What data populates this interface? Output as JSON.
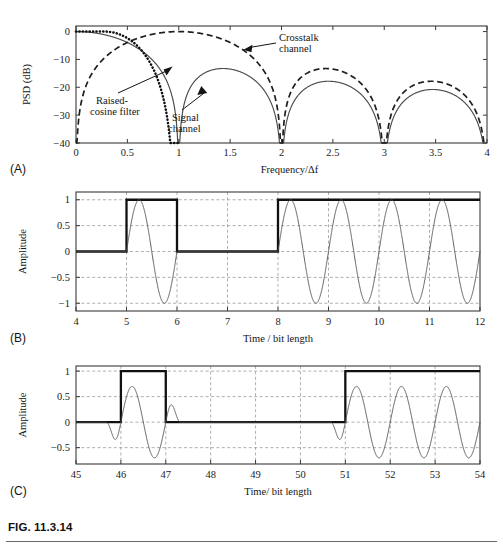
{
  "figure": {
    "caption": "FIG. 11.3.14",
    "panel_letters": {
      "a": "(A)",
      "b": "(B)",
      "c": "(C)"
    }
  },
  "chart_data": [
    {
      "id": "panel-a",
      "type": "line",
      "title": "",
      "xlabel": "Frequency/Δf",
      "ylabel": "PSD (dB)",
      "xlim": [
        0,
        4
      ],
      "ylim": [
        -40,
        2
      ],
      "xticks": [
        0,
        0.5,
        1,
        1.5,
        2,
        2.5,
        3,
        3.5,
        4
      ],
      "xticklabels": [
        "0",
        "0.5",
        "1",
        "1.5",
        "2",
        "2.5",
        "3",
        "3.5",
        "4"
      ],
      "yticks": [
        0,
        -10,
        -20,
        -30,
        -40
      ],
      "yticklabels": [
        "0",
        "−10",
        "−20",
        "−30",
        "−40"
      ],
      "grid": false,
      "legend_position": "annotations",
      "series": [
        {
          "name": "Signal channel",
          "style": "solid",
          "description": "sinc-squared main lobe centred at 0 with nulls at 1, 2, 3, 4",
          "nulls": [
            1,
            2,
            3,
            4
          ],
          "lobe_peaks_db": [
            0,
            -13.3,
            -18.2,
            -21.2
          ],
          "lobe_peak_x": [
            0,
            1.43,
            2.45,
            3.47
          ]
        },
        {
          "name": "Crosstalk channel",
          "style": "dashed",
          "description": "sinc-squared main lobe centred at 1 with nulls at 0, 2, 3, 4",
          "nulls": [
            0,
            2,
            3,
            4
          ],
          "lobe_peaks_db": [
            0,
            -13.3,
            -18.2
          ],
          "lobe_peak_x": [
            1,
            2.45,
            3.47
          ]
        },
        {
          "name": "Raised-cosine filter",
          "style": "dotted",
          "description": "raised cosine roll-off falling from 0 dB to the stop band near 1",
          "knee_x": 0.5,
          "cutoff_x": 1
        }
      ],
      "annotations": [
        {
          "text": "Crosstalk\nchannel",
          "lines": [
            "Crosstalk",
            "channel"
          ],
          "target_x": 1.63,
          "target_y_db": -6.5
        },
        {
          "text": "Raised-\ncosine filter",
          "lines": [
            "Raised-",
            "cosine filter"
          ],
          "target_x": 0.93,
          "target_y_db": -12.5
        },
        {
          "text": "Signal\nchannel",
          "lines": [
            "Signal",
            "channel"
          ],
          "target_x": 1.2,
          "target_y_db": -19.5
        }
      ]
    },
    {
      "id": "panel-b",
      "type": "line",
      "title": "",
      "xlabel": "Time / bit length",
      "ylabel": "Amplitude",
      "xlim": [
        4,
        12
      ],
      "ylim": [
        -1.15,
        1.15
      ],
      "xticks": [
        4,
        5,
        6,
        7,
        8,
        9,
        10,
        11,
        12
      ],
      "xticklabels": [
        "4",
        "5",
        "6",
        "7",
        "8",
        "9",
        "10",
        "11",
        "12"
      ],
      "yticks": [
        1,
        0.5,
        0,
        -0.5,
        -1
      ],
      "yticklabels": [
        "1",
        "0.5",
        "0",
        "−0.5",
        "−1"
      ],
      "grid": true,
      "series": [
        {
          "name": "Unfiltered data pulse",
          "style": "bold-square",
          "description": "rectangular NRZ data: 0 from 4-5, 1 from 5-6, 0 from 6-8, 1 from 8-12",
          "levels": [
            {
              "from": 4,
              "to": 5,
              "value": 0
            },
            {
              "from": 5,
              "to": 6,
              "value": 1
            },
            {
              "from": 6,
              "to": 8,
              "value": 0
            },
            {
              "from": 8,
              "to": 12,
              "value": 1
            }
          ]
        },
        {
          "name": "Modulated carrier",
          "style": "thin-sine",
          "description": "unit-amplitude sinusoid of period 1 bit, gated by the data pulse",
          "amplitude": 1,
          "period": 1,
          "gates": [
            [
              5,
              6
            ],
            [
              8,
              12
            ]
          ]
        }
      ]
    },
    {
      "id": "panel-c",
      "type": "line",
      "title": "",
      "xlabel": "Time/ bit length",
      "ylabel": "Amplitude",
      "xlim": [
        45,
        54
      ],
      "ylim": [
        -0.82,
        1.1
      ],
      "xticks": [
        45,
        46,
        47,
        48,
        49,
        50,
        51,
        52,
        53,
        54
      ],
      "xticklabels": [
        "45",
        "46",
        "47",
        "48",
        "49",
        "50",
        "51",
        "52",
        "53",
        "54"
      ],
      "yticks": [
        1,
        0.5,
        0,
        -0.5
      ],
      "yticklabels": [
        "1",
        "0.5",
        "0",
        "−0.5"
      ],
      "grid": true,
      "series": [
        {
          "name": "Unfiltered data pulse",
          "style": "bold-square",
          "description": "rectangular NRZ data: 0 from 45-46, 1 from 46-47, 0 from 47-51, 1 from 51-54",
          "levels": [
            {
              "from": 45,
              "to": 46,
              "value": 0
            },
            {
              "from": 46,
              "to": 47,
              "value": 1
            },
            {
              "from": 47,
              "to": 51,
              "value": 0
            },
            {
              "from": 51,
              "to": 54,
              "value": 1
            }
          ]
        },
        {
          "name": "Filtered modulated carrier",
          "style": "thin-sine",
          "description": "raised-cosine filtered sinusoid, peak amplitude about 0.7, with smooth rise and fall transitions",
          "amplitude": 0.7,
          "period": 1,
          "gates": [
            [
              46,
              47
            ],
            [
              51,
              54
            ]
          ]
        }
      ]
    }
  ]
}
